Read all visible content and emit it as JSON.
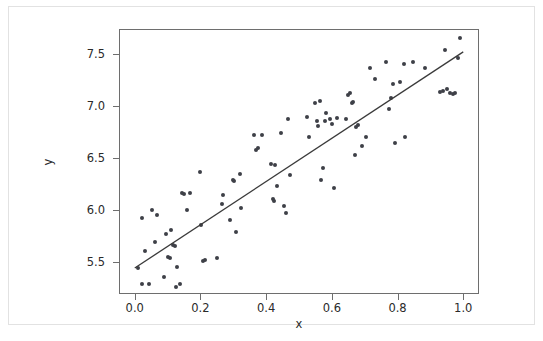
{
  "figure": {
    "background_color": "#ffffff",
    "frame_color": "#e2e2e2",
    "axes_edge_color": "#6e6e6e"
  },
  "chart_data": {
    "type": "scatter",
    "title": "",
    "subtitle": "",
    "xlabel": "x",
    "ylabel": "y",
    "xlim": [
      -0.048,
      1.048
    ],
    "ylim": [
      5.19,
      7.74
    ],
    "xticks": [
      0.0,
      0.2,
      0.4,
      0.6,
      0.8,
      1.0
    ],
    "xticklabels": [
      "0.0",
      "0.2",
      "0.4",
      "0.6",
      "0.8",
      "1.0"
    ],
    "yticks": [
      5.5,
      6.0,
      6.5,
      7.0,
      7.5
    ],
    "yticklabels": [
      "5.5",
      "6.0",
      "6.5",
      "7.0",
      "7.5"
    ],
    "grid": false,
    "legend": null,
    "annotations": [],
    "marker_color": "#3e4047",
    "marker_size": 4,
    "series": [
      {
        "name": "observations",
        "type": "scatter",
        "points": [
          [
            0.008,
            5.45
          ],
          [
            0.018,
            5.93
          ],
          [
            0.02,
            5.3
          ],
          [
            0.028,
            5.61
          ],
          [
            0.04,
            5.3
          ],
          [
            0.048,
            6.01
          ],
          [
            0.058,
            5.7
          ],
          [
            0.066,
            5.96
          ],
          [
            0.085,
            5.36
          ],
          [
            0.092,
            5.78
          ],
          [
            0.098,
            5.56
          ],
          [
            0.103,
            5.55
          ],
          [
            0.108,
            5.82
          ],
          [
            0.112,
            5.67
          ],
          [
            0.118,
            5.66
          ],
          [
            0.122,
            5.27
          ],
          [
            0.126,
            5.46
          ],
          [
            0.135,
            5.3
          ],
          [
            0.142,
            6.17
          ],
          [
            0.146,
            6.16
          ],
          [
            0.155,
            6.01
          ],
          [
            0.164,
            6.17
          ],
          [
            0.196,
            6.37
          ],
          [
            0.2,
            5.86
          ],
          [
            0.206,
            5.52
          ],
          [
            0.211,
            5.53
          ],
          [
            0.248,
            5.55
          ],
          [
            0.262,
            6.07
          ],
          [
            0.266,
            6.15
          ],
          [
            0.288,
            5.91
          ],
          [
            0.295,
            6.3
          ],
          [
            0.299,
            6.29
          ],
          [
            0.304,
            5.8
          ],
          [
            0.316,
            6.35
          ],
          [
            0.32,
            6.03
          ],
          [
            0.361,
            6.73
          ],
          [
            0.367,
            6.59
          ],
          [
            0.371,
            6.6
          ],
          [
            0.383,
            6.73
          ],
          [
            0.411,
            6.45
          ],
          [
            0.417,
            6.11
          ],
          [
            0.42,
            6.09
          ],
          [
            0.424,
            6.44
          ],
          [
            0.43,
            6.24
          ],
          [
            0.443,
            6.75
          ],
          [
            0.45,
            6.05
          ],
          [
            0.458,
            5.98
          ],
          [
            0.462,
            6.88
          ],
          [
            0.47,
            6.34
          ],
          [
            0.521,
            6.9
          ],
          [
            0.528,
            6.71
          ],
          [
            0.545,
            7.04
          ],
          [
            0.552,
            6.86
          ],
          [
            0.556,
            6.82
          ],
          [
            0.56,
            7.06
          ],
          [
            0.564,
            6.3
          ],
          [
            0.57,
            6.41
          ],
          [
            0.575,
            6.86
          ],
          [
            0.58,
            6.94
          ],
          [
            0.592,
            6.88
          ],
          [
            0.598,
            6.84
          ],
          [
            0.602,
            6.22
          ],
          [
            0.612,
            6.89
          ],
          [
            0.64,
            6.88
          ],
          [
            0.646,
            7.11
          ],
          [
            0.652,
            7.13
          ],
          [
            0.658,
            7.04
          ],
          [
            0.662,
            7.05
          ],
          [
            0.666,
            6.54
          ],
          [
            0.671,
            6.81
          ],
          [
            0.676,
            6.83
          ],
          [
            0.688,
            6.62
          ],
          [
            0.7,
            6.71
          ],
          [
            0.712,
            7.37
          ],
          [
            0.728,
            7.27
          ],
          [
            0.762,
            7.43
          ],
          [
            0.771,
            6.98
          ],
          [
            0.776,
            7.09
          ],
          [
            0.782,
            7.22
          ],
          [
            0.79,
            6.65
          ],
          [
            0.805,
            7.24
          ],
          [
            0.816,
            7.41
          ],
          [
            0.82,
            6.71
          ],
          [
            0.845,
            7.43
          ],
          [
            0.88,
            7.37
          ],
          [
            0.926,
            7.14
          ],
          [
            0.934,
            7.15
          ],
          [
            0.94,
            7.55
          ],
          [
            0.948,
            7.17
          ],
          [
            0.958,
            7.13
          ],
          [
            0.966,
            7.12
          ],
          [
            0.972,
            7.13
          ],
          [
            0.98,
            7.47
          ],
          [
            0.988,
            7.66
          ]
        ]
      },
      {
        "name": "regression-line",
        "type": "line",
        "color": "#3a3a3a",
        "linewidth": 1.2,
        "endpoints": [
          [
            0.0,
            5.44
          ],
          [
            1.0,
            7.52
          ]
        ],
        "slope": 2.08,
        "intercept": 5.44
      }
    ]
  }
}
